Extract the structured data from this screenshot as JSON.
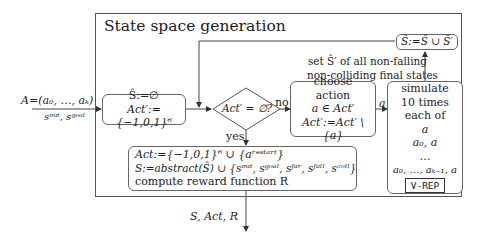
{
  "diagram": {
    "title": "State space generation",
    "inputs": {
      "top": "A=(a₀, …, aₖ)",
      "bottom": "sᶦⁿᶦᵗ, sᵍᵒᵃˡ"
    },
    "init_box": {
      "line1": "Ŝ:=∅",
      "line2": "Act′:={−1,0,1}⁶"
    },
    "decision": {
      "label": "Act′ = ∅?",
      "no_label": "no",
      "yes_label": "yes"
    },
    "choose_box": {
      "line1": "choose",
      "line2": "action",
      "line3": "a ∈ Act′",
      "line4": "Act′:=Act′ \\ {a}"
    },
    "edge_a_label": "a",
    "simulate_box": {
      "line1": "simulate",
      "line2": "10 times",
      "line3": "each of",
      "line4": "a",
      "line5": "a₀, a",
      "line6": "…",
      "line7": "a₀, …, aₖ₋₁, a",
      "tag": "V-REP"
    },
    "set_label": {
      "line1": "set Ŝ′ of all non-falling",
      "line2": "non-colliding final states"
    },
    "union_box": "Ŝ:=Ŝ ∪ Ŝ′",
    "final_box": {
      "line1": "Act:={−1,0,1}⁶ ∪ {aʳᵉˢᵗᵃʳᵗ}",
      "line2": "S:=abstract(Ŝ) ∪ {sᶦⁿᶦᵗ, sᵍᵒᵃˡ, sᶠᵃʳ, sᶠᵃˡˡ, sᶜᵒˡˡ}",
      "line3": "compute reward function R"
    },
    "output_label": "S, Act, R"
  }
}
